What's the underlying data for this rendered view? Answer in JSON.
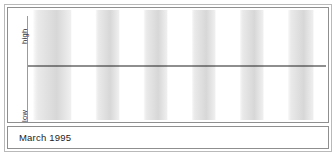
{
  "window": {
    "title": "Biorhythm Chart"
  },
  "axis": {
    "high_label": "high",
    "low_label": "low",
    "tick_labels": [
      "5",
      "10",
      "15",
      "20",
      "25",
      "30"
    ],
    "tick_values": [
      5,
      10,
      15,
      20,
      25,
      30
    ],
    "minor_tick_step": 1
  },
  "footer": {
    "period_label": "March 1995"
  },
  "colors": {
    "curve": "#5a5a5a",
    "band": "#d5d5d5",
    "axis": "#1f1f1f",
    "frame": "#8f8f8f",
    "outer_frame": "#b9b9b9",
    "marker": "#3a3a3a",
    "background": "#ffffff"
  },
  "chart_data": {
    "type": "line",
    "title": "",
    "subtitle": "",
    "xlabel": "",
    "ylabel": "",
    "xlim": [
      0.5,
      31.5
    ],
    "ylim": [
      -1,
      1
    ],
    "grid": false,
    "legend": "none",
    "x_tick_labels": [
      "5",
      "10",
      "15",
      "20",
      "25",
      "30"
    ],
    "y_tick_labels": [
      "high",
      "low"
    ],
    "annotations": [
      {
        "name": "today-marker",
        "type": "vline",
        "x": 22,
        "label": ""
      }
    ],
    "shaded_bands": [
      {
        "from": 1.0,
        "to": 5.0
      },
      {
        "from": 7.5,
        "to": 10.0
      },
      {
        "from": 12.5,
        "to": 15.0
      },
      {
        "from": 17.5,
        "to": 20.0
      },
      {
        "from": 22.5,
        "to": 25.0
      },
      {
        "from": 27.5,
        "to": 30.2
      }
    ],
    "series": [
      {
        "name": "physical",
        "cycle_days": 23,
        "zero_crossing_day": 22,
        "phase_direction": "rising",
        "amplitude": 1
      },
      {
        "name": "emotional",
        "cycle_days": 28,
        "zero_crossing_day": 22,
        "phase_direction": "falling",
        "amplitude": 1
      },
      {
        "name": "intellectual",
        "cycle_days": 33,
        "zero_crossing_day": 22,
        "phase_direction": "falling",
        "amplitude": 1
      }
    ]
  }
}
